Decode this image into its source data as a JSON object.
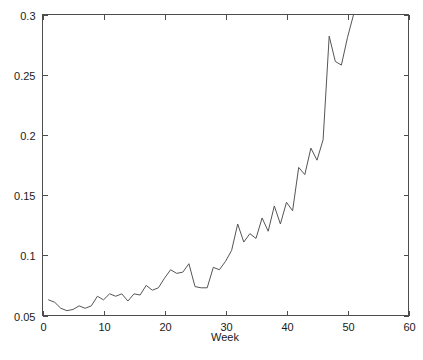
{
  "chart_data": {
    "type": "line",
    "title": "",
    "xlabel": "Week",
    "ylabel": "",
    "xlim": [
      0,
      60
    ],
    "ylim": [
      0.05,
      0.3
    ],
    "grid": false,
    "legend": null,
    "xticks": [
      0,
      10,
      20,
      30,
      40,
      50,
      60
    ],
    "xtick_labels": [
      "0",
      "10",
      "20",
      "30",
      "40",
      "50",
      "60"
    ],
    "yticks": [
      0.05,
      0.1,
      0.15,
      0.2,
      0.25,
      0.3
    ],
    "ytick_labels": [
      "0.05",
      "0.1",
      "0.15",
      "0.2",
      "0.25",
      "0.3"
    ],
    "series": [
      {
        "name": "series-1",
        "color": "#555555",
        "x": [
          1,
          2,
          3,
          4,
          5,
          6,
          7,
          8,
          9,
          10,
          11,
          12,
          13,
          14,
          15,
          16,
          17,
          18,
          19,
          20,
          21,
          22,
          23,
          24,
          25,
          26,
          27,
          28,
          29,
          30,
          31,
          32,
          33,
          34,
          35,
          36,
          37,
          38,
          39,
          40,
          41,
          42,
          43,
          44,
          45,
          46,
          47,
          48,
          49,
          50,
          51
        ],
        "values": [
          0.063,
          0.061,
          0.056,
          0.054,
          0.055,
          0.058,
          0.056,
          0.058,
          0.066,
          0.063,
          0.068,
          0.066,
          0.068,
          0.062,
          0.068,
          0.067,
          0.075,
          0.071,
          0.073,
          0.081,
          0.088,
          0.085,
          0.086,
          0.093,
          0.074,
          0.073,
          0.073,
          0.09,
          0.088,
          0.095,
          0.104,
          0.126,
          0.111,
          0.118,
          0.114,
          0.131,
          0.12,
          0.141,
          0.126,
          0.144,
          0.137,
          0.173,
          0.167,
          0.189,
          0.179,
          0.196,
          0.282,
          0.261,
          0.258,
          0.281,
          0.3
        ]
      }
    ]
  },
  "axis": {
    "x_title": "Week",
    "y_title": ""
  }
}
